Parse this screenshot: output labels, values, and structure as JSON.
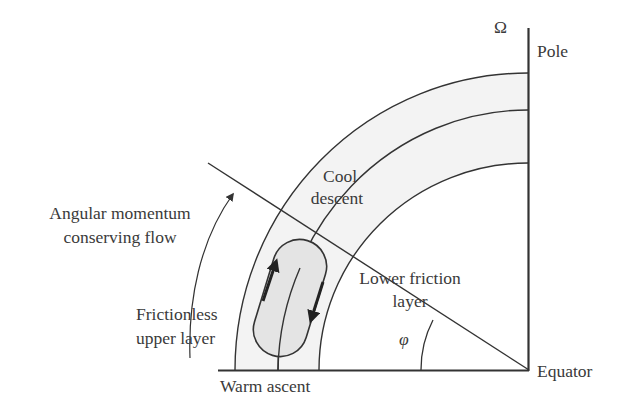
{
  "diagram": {
    "type": "atmospheric-circulation-schematic",
    "colors": {
      "line": "#333333",
      "text": "#3a3a3a",
      "band_fill": "#f3f3f3",
      "cell_fill": "#e4e4e4",
      "background": "#ffffff"
    },
    "labels": {
      "omega": "Ω",
      "pole": "Pole",
      "equator": "Equator",
      "cool_descent_1": "Cool",
      "cool_descent_2": "descent",
      "angular_momentum_1": "Angular momentum",
      "angular_momentum_2": "conserving flow",
      "frictionless_1": "Frictionless",
      "frictionless_2": "upper layer",
      "lower_friction_1": "Lower friction",
      "lower_friction_2": "layer",
      "latitude_symbol": "φ",
      "warm_ascent": "Warm ascent"
    },
    "elements": {
      "axes": [
        "pole-axis (vertical)",
        "equator-axis (horizontal)"
      ],
      "layers": [
        "frictionless upper layer",
        "lower friction layer"
      ],
      "circulation_cell": "closed overturning cell with upward arrow (warm ascent side) and downward arrow (cool descent side)",
      "latitude_line": "radial line at angle φ from equator",
      "curved_arrow": "angular momentum conserving flow, poleward"
    }
  }
}
